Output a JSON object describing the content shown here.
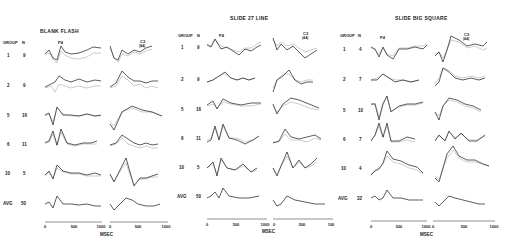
{
  "figure": {
    "panels": [
      {
        "title": "BLANK FLASH",
        "col_headers": {
          "group": "GROUP",
          "n": "N",
          "left_electrode": "P4",
          "right_electrode": "C3",
          "right_sub": "(AA)"
        },
        "rows": [
          {
            "group": "1",
            "n": "9"
          },
          {
            "group": "2",
            "n": "9"
          },
          {
            "group": "5",
            "n": "16"
          },
          {
            "group": "6",
            "n": "11"
          },
          {
            "group": "10",
            "n": "5"
          },
          {
            "group": "AVG",
            "n": "50"
          }
        ],
        "x_ticks_left": [
          "0",
          "500",
          "1000"
        ],
        "x_ticks_right": [
          "0",
          "500",
          "1000"
        ],
        "x_label": "MSEC"
      },
      {
        "title": "SLIDE 27 LINE",
        "col_headers": {
          "group": "GROUP",
          "n": "N",
          "left_electrode": "P4",
          "right_electrode": "C3",
          "right_sub": "(AA)"
        },
        "rows": [
          {
            "group": "1",
            "n": "9"
          },
          {
            "group": "2",
            "n": "9"
          },
          {
            "group": "5",
            "n": "16"
          },
          {
            "group": "6",
            "n": "11"
          },
          {
            "group": "10",
            "n": "5"
          },
          {
            "group": "AVG",
            "n": "50"
          }
        ],
        "x_ticks_left": [
          "0",
          "500",
          "1000"
        ],
        "x_ticks_right": [
          "0",
          "500",
          "100"
        ],
        "x_label": "MSEC"
      },
      {
        "title": "SLIDE BIG SQUARE",
        "col_headers": {
          "group": "GROUP",
          "n": "N",
          "left_electrode": "P4",
          "right_electrode": "C3",
          "right_sub": "(AA)"
        },
        "rows": [
          {
            "group": "1",
            "n": "4"
          },
          {
            "group": "2",
            "n": "7"
          },
          {
            "group": "5",
            "n": "10"
          },
          {
            "group": "6",
            "n": "7"
          },
          {
            "group": "10",
            "n": "4"
          },
          {
            "group": "AVG",
            "n": "32"
          }
        ],
        "x_ticks_left": [
          "0",
          "500",
          "1000"
        ],
        "x_ticks_right": [
          "0",
          "500",
          "1000"
        ],
        "x_label": "MSEC"
      }
    ]
  }
}
